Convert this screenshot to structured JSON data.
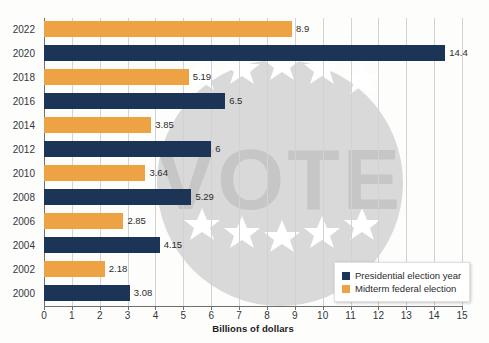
{
  "chart_data": {
    "type": "bar",
    "orientation": "horizontal",
    "title": "",
    "xlabel": "Billions of dollars",
    "ylabel": "",
    "xlim": [
      0,
      15
    ],
    "xticks": [
      0,
      1,
      2,
      3,
      4,
      5,
      6,
      7,
      8,
      9,
      10,
      11,
      12,
      13,
      14,
      15
    ],
    "grid": "vertical",
    "legend_position": "bottom-right",
    "categories": [
      "2022",
      "2020",
      "2018",
      "2016",
      "2014",
      "2012",
      "2010",
      "2008",
      "2006",
      "2004",
      "2002",
      "2000"
    ],
    "values": [
      8.9,
      14.4,
      5.19,
      6.5,
      3.85,
      6,
      3.64,
      5.29,
      2.85,
      4.15,
      2.18,
      3.08
    ],
    "value_labels": [
      "8.9",
      "14.4",
      "5.19",
      "6.5",
      "3.85",
      "6",
      "3.64",
      "5.29",
      "2.85",
      "4.15",
      "2.18",
      "3.08"
    ],
    "series_of": [
      "midterm",
      "presidential",
      "midterm",
      "presidential",
      "midterm",
      "presidential",
      "midterm",
      "presidential",
      "midterm",
      "presidential",
      "midterm",
      "presidential"
    ],
    "series": [
      {
        "name": "Presidential election year",
        "key": "presidential",
        "color": "#1C3557",
        "points": [
          {
            "category": "2020",
            "value": 14.4
          },
          {
            "category": "2016",
            "value": 6.5
          },
          {
            "category": "2012",
            "value": 6
          },
          {
            "category": "2008",
            "value": 5.29
          },
          {
            "category": "2004",
            "value": 4.15
          },
          {
            "category": "2000",
            "value": 3.08
          }
        ]
      },
      {
        "name": "Midterm federal election",
        "key": "midterm",
        "color": "#EDA244",
        "points": [
          {
            "category": "2022",
            "value": 8.9
          },
          {
            "category": "2018",
            "value": 5.19
          },
          {
            "category": "2014",
            "value": 3.85
          },
          {
            "category": "2010",
            "value": 3.64
          },
          {
            "category": "2006",
            "value": 2.85
          },
          {
            "category": "2002",
            "value": 2.18
          }
        ]
      }
    ]
  },
  "axis": {
    "x_title": "Billions of dollars",
    "tick_labels": [
      "0",
      "1",
      "2",
      "3",
      "4",
      "5",
      "6",
      "7",
      "8",
      "9",
      "10",
      "11",
      "12",
      "13",
      "14",
      "15"
    ]
  },
  "legend": {
    "items": [
      {
        "label": "Presidential election year",
        "key": "presidential",
        "color": "#1C3557"
      },
      {
        "label": "Midterm federal election",
        "key": "midterm",
        "color": "#EDA244"
      }
    ]
  },
  "watermark": {
    "text": "VOTE",
    "color": "#d4d4d4"
  },
  "colors": {
    "presidential": "#1C3557",
    "midterm": "#EDA244",
    "grid": "#D2D2D2",
    "axis": "#6F6F6F",
    "text": "#33373B",
    "background": "#FDFDFC"
  }
}
